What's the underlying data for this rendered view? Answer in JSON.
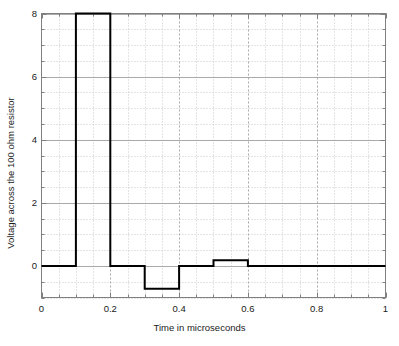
{
  "chart_data": {
    "type": "line",
    "title": "",
    "xlabel": "Time in microseconds",
    "ylabel": "Voltage across the 100 ohm resistor",
    "xlim": [
      0,
      1
    ],
    "ylim": [
      -1,
      8
    ],
    "grid": true,
    "legend": null,
    "xticks": [
      0,
      0.2,
      0.4,
      0.6,
      0.8,
      1
    ],
    "xtick_labels": [
      "0",
      "0.2",
      "0.4",
      "0.6",
      "0.8",
      "1"
    ],
    "yticks": [
      0,
      2,
      4,
      6,
      8
    ],
    "ytick_labels": [
      "0",
      "2",
      "4",
      "6",
      "8"
    ],
    "x_minor_step": 0.05,
    "y_minor_step": 0.5,
    "series": [
      {
        "name": "voltage",
        "style": "step",
        "color": "#000000",
        "line_width": 2,
        "x": [
          0,
          0.1,
          0.1,
          0.2,
          0.2,
          0.3,
          0.3,
          0.4,
          0.4,
          0.5,
          0.5,
          0.6,
          0.6,
          1.0
        ],
        "y": [
          0,
          0,
          8,
          8,
          0,
          0,
          -0.72,
          -0.72,
          0,
          0,
          0.18,
          0.18,
          0,
          0
        ],
        "segments": [
          {
            "x_start": 0.0,
            "x_end": 0.1,
            "value": 0
          },
          {
            "x_start": 0.1,
            "x_end": 0.2,
            "value": 8
          },
          {
            "x_start": 0.2,
            "x_end": 0.3,
            "value": 0
          },
          {
            "x_start": 0.3,
            "x_end": 0.4,
            "value": -0.72
          },
          {
            "x_start": 0.4,
            "x_end": 0.5,
            "value": 0
          },
          {
            "x_start": 0.5,
            "x_end": 0.6,
            "value": 0.18
          },
          {
            "x_start": 0.6,
            "x_end": 1.0,
            "value": 0
          }
        ]
      }
    ],
    "colors": {
      "line": "#000000",
      "axis": "#808080",
      "major_grid": "#aaaaaa",
      "minor_grid": "#c8c8c8",
      "background": "#ffffff",
      "text": "#1a1a1a"
    }
  }
}
